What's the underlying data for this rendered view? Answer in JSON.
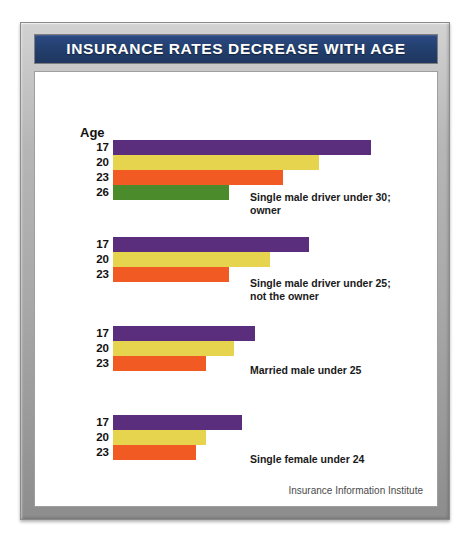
{
  "title": "INSURANCE RATES DECREASE WITH AGE",
  "axis_title": "Age",
  "source": "Insurance Information Institute",
  "colors": {
    "purple": "#5a2d7d",
    "yellow": "#e6d44e",
    "orange": "#f15a22",
    "green": "#4c8b2b",
    "title_bg": "#24406f",
    "frame": "#a9a9a9",
    "panel_bg": "#ffffff"
  },
  "chart_data": {
    "type": "bar",
    "title": "INSURANCE RATES DECREASE WITH AGE",
    "xlabel": "",
    "ylabel": "Age",
    "orientation": "horizontal",
    "grid": false,
    "legend": "none",
    "xlim": [
      0,
      100
    ],
    "note": "Bar lengths are relative insurance rate index values, normalized so the longest bar (age 17, single male driver under 30, owner) equals 100.",
    "groups": [
      {
        "caption": "Single male driver under 30;\nowner",
        "categories": [
          "17",
          "20",
          "23",
          "26"
        ],
        "values": [
          100,
          80,
          66,
          45
        ],
        "colors": [
          "#5a2d7d",
          "#e6d44e",
          "#f15a22",
          "#4c8b2b"
        ]
      },
      {
        "caption": "Single male driver under 25;\nnot the owner",
        "categories": [
          "17",
          "20",
          "23"
        ],
        "values": [
          76,
          61,
          45
        ],
        "colors": [
          "#5a2d7d",
          "#e6d44e",
          "#f15a22"
        ]
      },
      {
        "caption": "Married male under 25",
        "categories": [
          "17",
          "20",
          "23"
        ],
        "values": [
          55,
          47,
          36
        ],
        "colors": [
          "#5a2d7d",
          "#e6d44e",
          "#f15a22"
        ]
      },
      {
        "caption": "Single female under 24",
        "categories": [
          "17",
          "20",
          "23"
        ],
        "values": [
          50,
          36,
          32
        ],
        "colors": [
          "#5a2d7d",
          "#e6d44e",
          "#f15a22"
        ]
      }
    ]
  },
  "groups": [
    {
      "caption": "Single male driver under 30;\nowner",
      "caption_top": 119,
      "top": 68,
      "rows": [
        {
          "label": "17",
          "value": 100,
          "color": "#5a2d7d"
        },
        {
          "label": "20",
          "value": 80,
          "color": "#e6d44e"
        },
        {
          "label": "23",
          "value": 66,
          "color": "#f15a22"
        },
        {
          "label": "26",
          "value": 45,
          "color": "#4c8b2b"
        }
      ]
    },
    {
      "caption": "Single male driver under 25;\nnot the owner",
      "caption_top": 205,
      "top": 165,
      "rows": [
        {
          "label": "17",
          "value": 76,
          "color": "#5a2d7d"
        },
        {
          "label": "20",
          "value": 61,
          "color": "#e6d44e"
        },
        {
          "label": "23",
          "value": 45,
          "color": "#f15a22"
        }
      ]
    },
    {
      "caption": "Married male under 25",
      "caption_top": 292,
      "top": 254,
      "rows": [
        {
          "label": "17",
          "value": 55,
          "color": "#5a2d7d"
        },
        {
          "label": "20",
          "value": 47,
          "color": "#e6d44e"
        },
        {
          "label": "23",
          "value": 36,
          "color": "#f15a22"
        }
      ]
    },
    {
      "caption": "Single female under 24",
      "caption_top": 381,
      "top": 343,
      "rows": [
        {
          "label": "17",
          "value": 50,
          "color": "#5a2d7d"
        },
        {
          "label": "20",
          "value": 36,
          "color": "#e6d44e"
        },
        {
          "label": "23",
          "value": 32,
          "color": "#f15a22"
        }
      ]
    }
  ]
}
